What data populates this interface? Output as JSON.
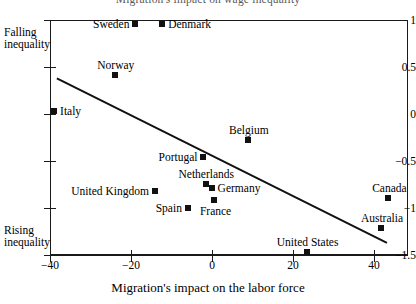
{
  "chart_data": {
    "type": "scatter",
    "title": "Migration's impact on wage inequality",
    "xlabel": "Migration's impact on the labor force",
    "ylabel": "",
    "xlim": [
      -40,
      50
    ],
    "ylim": [
      -1.5,
      1
    ],
    "xticks": [
      -40,
      -20,
      0,
      20,
      40
    ],
    "xtick_labels": [
      "−40",
      "−20",
      "0",
      "20",
      "40"
    ],
    "yticks": [
      1,
      0.5,
      0,
      -0.5,
      -1,
      -1.5
    ],
    "ytick_labels": [
      "1",
      "0.5",
      "0",
      "−0.5",
      "−1",
      "−1.5"
    ],
    "grid": false,
    "legend": null,
    "annotations": {
      "top_left": [
        "Falling",
        "inequality"
      ],
      "bottom_left": [
        "Rising",
        "inequality"
      ]
    },
    "points": [
      {
        "label": "Sweden",
        "x": -19.0,
        "y": 0.96,
        "label_side": "left"
      },
      {
        "label": "Denmark",
        "x": -12.3,
        "y": 0.96,
        "label_side": "right"
      },
      {
        "label": "Norway",
        "x": -24.0,
        "y": 0.42,
        "label_side": "above"
      },
      {
        "label": "Italy",
        "x": -39.0,
        "y": 0.03,
        "label_side": "right"
      },
      {
        "label": "Belgium",
        "x": 8.9,
        "y": -0.28,
        "label_side": "above"
      },
      {
        "label": "Portugal",
        "x": -2.1,
        "y": -0.46,
        "label_side": "left"
      },
      {
        "label": "Netherlands",
        "x": -1.6,
        "y": -0.74,
        "label_side": "above"
      },
      {
        "label": "Germany",
        "x": -0.1,
        "y": -0.79,
        "label_side": "right"
      },
      {
        "label": "United Kingdom",
        "x": -14.0,
        "y": -0.82,
        "label_side": "left"
      },
      {
        "label": "France",
        "x": 0.6,
        "y": -0.91,
        "label_side": "below"
      },
      {
        "label": "Spain",
        "x": -6.0,
        "y": -1.0,
        "label_side": "left"
      },
      {
        "label": "Canada",
        "x": 43.5,
        "y": -0.89,
        "label_side": "above"
      },
      {
        "label": "Australia",
        "x": 41.7,
        "y": -1.21,
        "label_side": "above"
      },
      {
        "label": "United States",
        "x": 23.4,
        "y": -1.47,
        "label_side": "above"
      }
    ],
    "trendline": {
      "x_start": -38.3,
      "y_start": 0.38,
      "x_end": 43.2,
      "y_end": -1.37
    }
  }
}
